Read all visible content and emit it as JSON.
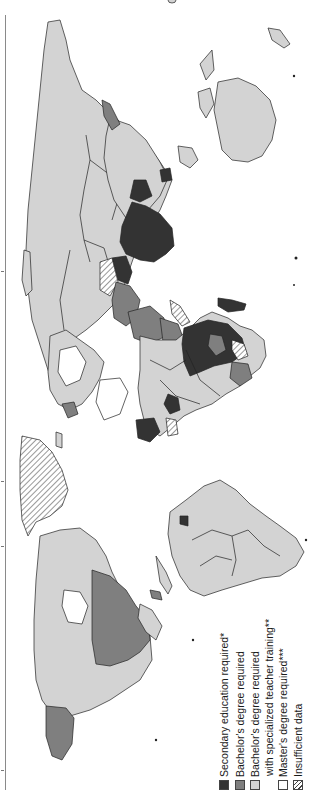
{
  "map": {
    "orientation": "rotated 90 degrees counter-clockwise (north at left)",
    "colors": {
      "secondary": "#333333",
      "bachelors": "#7f7f7f",
      "bachelors_specialized": "#d3d3d3",
      "masters": "#ffffff",
      "insufficient": "hatched",
      "border": "#222222"
    }
  },
  "legend": {
    "items": [
      {
        "key": "secondary",
        "label": "Secondary education required*",
        "color": "#333333"
      },
      {
        "key": "bachelors",
        "label": "Bachelor's degree required",
        "color": "#7f7f7f"
      },
      {
        "key": "bachelors_specialized",
        "label": "Bachelor's degree required",
        "label2": "with specialized teacher training**",
        "color": "#d3d3d3"
      },
      {
        "key": "masters",
        "label": "Master's degree required***",
        "color": "#ffffff"
      },
      {
        "key": "insufficient",
        "label": "Insufficient data",
        "color": "hatched"
      }
    ]
  }
}
